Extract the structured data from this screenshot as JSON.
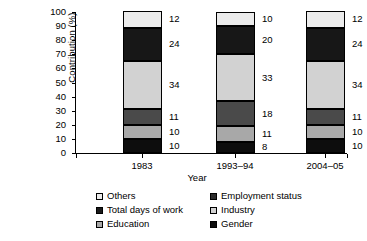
{
  "chart_data": {
    "type": "bar",
    "subtype": "stacked-bar",
    "title": "",
    "xlabel": "Year",
    "ylabel": "Contribution (%)",
    "categories": [
      "1983",
      "1993–94",
      "2004–05"
    ],
    "ylim": [
      0,
      100
    ],
    "yticks": [
      0,
      10,
      20,
      30,
      40,
      50,
      60,
      70,
      80,
      90,
      100
    ],
    "ytick_labels": [
      "0",
      "10",
      "20",
      "30",
      "40",
      "50",
      "60",
      "70",
      "80",
      "90",
      "100"
    ],
    "grid": false,
    "legend_position": "bottom",
    "stack_order_bottom_to_top": [
      "Gender",
      "Education",
      "Total days of work",
      "Industry",
      "Employment status",
      "Others"
    ],
    "series": [
      {
        "name": "Gender",
        "values": [
          10,
          8,
          10
        ],
        "color": "#0d0d0d"
      },
      {
        "name": "Education",
        "values": [
          10,
          11,
          10
        ],
        "color": "#a8a8a8"
      },
      {
        "name": "Total days of work",
        "values": [
          11,
          18,
          11
        ],
        "color": "#4a4a4a"
      },
      {
        "name": "Industry",
        "values": [
          34,
          33,
          34
        ],
        "color": "#d2d2d2"
      },
      {
        "name": "Employment status",
        "values": [
          24,
          20,
          24
        ],
        "color": "#171717"
      },
      {
        "name": "Others",
        "values": [
          12,
          10,
          12
        ],
        "color": "#ebebeb"
      }
    ],
    "data_labels": {
      "1983": {
        "Others": "12",
        "Employment status": "24",
        "Industry": "34",
        "Total days of work": "11",
        "Education": "10",
        "Gender": "10"
      },
      "1993–94": {
        "Others": "10",
        "Employment status": "20",
        "Industry": "33",
        "Total days of work": "18",
        "Education": "11",
        "Gender": "8"
      },
      "2004–05": {
        "Others": "12",
        "Employment status": "24",
        "Industry": "34",
        "Total days of work": "11",
        "Education": "10",
        "Gender": "10"
      }
    }
  },
  "axes": {
    "y_title": "Contribution (%)",
    "x_title": "Year",
    "y_tick_labels": [
      "100",
      "90",
      "80",
      "70",
      "60",
      "50",
      "40",
      "30",
      "20",
      "10",
      "0"
    ],
    "x_tick_labels": [
      "1983",
      "1993–94",
      "2004–05"
    ]
  },
  "legend": {
    "left_column": [
      {
        "label": "Others",
        "color": "#ebebeb"
      },
      {
        "label": "Total days of work",
        "color": "#1a1a1a"
      },
      {
        "label": "Education",
        "color": "#a8a8a8"
      }
    ],
    "right_column": [
      {
        "label": "Employment status",
        "color": "#2b2b2b"
      },
      {
        "label": "Industry",
        "color": "#d2d2d2"
      },
      {
        "label": "Gender",
        "color": "#0d0d0d"
      }
    ]
  }
}
